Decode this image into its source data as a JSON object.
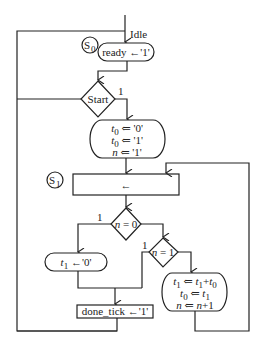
{
  "diagram": {
    "type": "asm-chart",
    "entry_label": "Idle",
    "states": [
      {
        "id": "S0",
        "label": "S",
        "sub": "0"
      },
      {
        "id": "S1",
        "label": "S",
        "sub": "1"
      }
    ],
    "blocks": {
      "ready": {
        "text": "ready ←'1'"
      },
      "start_decision": {
        "text": "Start",
        "branch_label": "1"
      },
      "init": {
        "lines": [
          {
            "var": "t",
            "sub": "0",
            "op": "⇐",
            "val": "'0'"
          },
          {
            "var": "t",
            "sub": "0",
            "op": "⇐",
            "val": "'1'"
          },
          {
            "var": "n",
            "sub": "",
            "op": "⇐",
            "val": "'1'"
          }
        ]
      },
      "s1_box": {
        "text": "←"
      },
      "n0_decision": {
        "text": "n = 0",
        "branch_label": "1"
      },
      "n1_decision": {
        "text": "n = 1",
        "branch_label": "1"
      },
      "t1_assign": {
        "var": "t",
        "sub": "1",
        "op": "←",
        "val": "'0'"
      },
      "update": {
        "line1": "t₁ ⇐ t₁+t₀",
        "line2": "t₀ ⇐ t₁",
        "line3": "n ⇐ n+1"
      },
      "done_tick": {
        "text": "done_tick ←'1'"
      }
    }
  }
}
